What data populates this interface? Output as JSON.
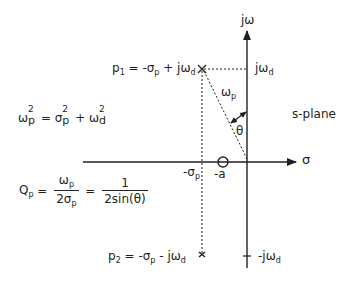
{
  "diagram": {
    "type": "s-plane pole-zero diagram",
    "axes": {
      "vertical_label": "jω",
      "horizontal_label": "σ"
    },
    "plane_label": "s-plane",
    "poles": [
      {
        "name": "p",
        "index": "1",
        "expr_parts": [
          "-σ",
          "p",
          " + jω",
          "d"
        ],
        "marker": "x"
      },
      {
        "name": "p",
        "index": "2",
        "expr_parts": [
          "-σ",
          "p",
          " - jω",
          "d"
        ],
        "marker": "x"
      }
    ],
    "zero": {
      "label": "-a",
      "marker": "o"
    },
    "axis_ticks": {
      "top": {
        "base": "jω",
        "sub": "d"
      },
      "bottom": {
        "base": "-jω",
        "sub": "d"
      },
      "sigma": {
        "base": "-σ",
        "sub": "p"
      }
    },
    "vector": {
      "label_base": "ω",
      "label_sub": "p",
      "angle_label": "θ"
    },
    "equations": {
      "omega": {
        "lhs": "ω",
        "lhs_sub": "p",
        "eq": " = ",
        "t1": "σ",
        "t1_sub": "p",
        "plus": " + ",
        "t2": "ω",
        "t2_sub": "d",
        "sup": "2"
      },
      "q": {
        "lhs": "Q",
        "lhs_sub": "p",
        "eq1": " = ",
        "num1": "ω",
        "num1_sub": "p",
        "den1": "2σ",
        "den1_sub": "p",
        "eq2": " = ",
        "num2": "1",
        "den2": "2sin(θ)"
      }
    }
  }
}
